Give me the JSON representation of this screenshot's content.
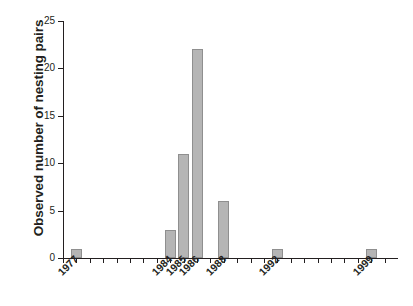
{
  "chart_data": {
    "type": "bar",
    "title": "",
    "xlabel": "",
    "ylabel": "Observed number of nesting pairs",
    "categories": [
      "1977",
      "1984",
      "1985",
      "1986",
      "1988",
      "1992",
      "1999"
    ],
    "values": [
      1,
      3,
      11,
      22,
      6,
      1,
      1
    ],
    "ylim": [
      0,
      25
    ],
    "yticks": [
      0,
      5,
      10,
      15,
      20,
      25
    ],
    "ytick_labels": [
      "0",
      "5",
      "10",
      "15",
      "20",
      "25"
    ],
    "xlim": [
      1976,
      2001
    ],
    "xticks": [
      1976,
      1977,
      1978,
      1979,
      1980,
      1981,
      1982,
      1983,
      1984,
      1985,
      1986,
      1987,
      1988,
      1989,
      1990,
      1991,
      1992,
      1993,
      1994,
      1995,
      1996,
      1997,
      1998,
      1999,
      2000
    ],
    "xtick_labels_shown": [
      "1977",
      "1984",
      "1985",
      "1986",
      "1988",
      "1992",
      "1999"
    ],
    "grid": false,
    "legend": null,
    "bar_color": "#b5b5b5",
    "bar_edge_color": "#8f8f8f",
    "axis_color": "#231f20",
    "background": "#ffffff",
    "bars": [
      {
        "category": "1977",
        "value": 1
      },
      {
        "category": "1984",
        "value": 3
      },
      {
        "category": "1985",
        "value": 11
      },
      {
        "category": "1986",
        "value": 22
      },
      {
        "category": "1988",
        "value": 6
      },
      {
        "category": "1992",
        "value": 1
      },
      {
        "category": "1999",
        "value": 1
      }
    ]
  }
}
